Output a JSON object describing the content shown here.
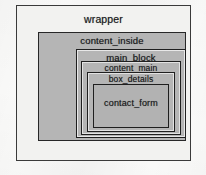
{
  "diagram": {
    "colors": {
      "page_background": "#fbfbfa",
      "wrapper_fill": "#f2f2f0",
      "inner_fill": "#b5b5b5",
      "innermost_fill": "#b2b2b2",
      "border": "#2a2a2a",
      "text": "#17181a"
    },
    "boxes": [
      {
        "id": "wrapper",
        "label": "wrapper",
        "depth": 0
      },
      {
        "id": "content_inside",
        "label": "content_inside",
        "depth": 1
      },
      {
        "id": "main_block",
        "label": "main_block",
        "depth": 2
      },
      {
        "id": "content_main",
        "label": "content_main",
        "depth": 3
      },
      {
        "id": "box_details",
        "label": "box_details",
        "depth": 4
      },
      {
        "id": "contact_form",
        "label": "contact_form",
        "depth": 5
      }
    ]
  }
}
